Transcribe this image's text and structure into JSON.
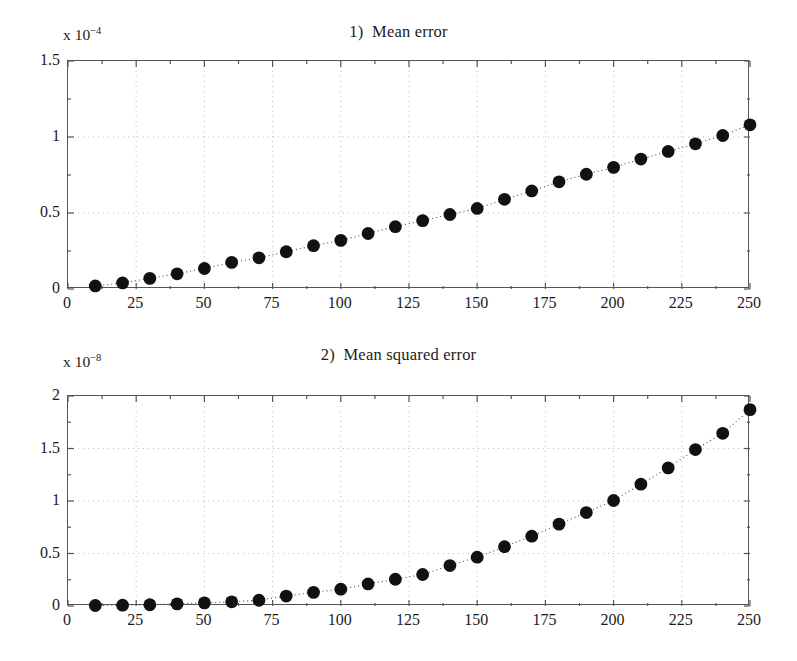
{
  "figure": {
    "background": "#ffffff",
    "marker_color": "#111111",
    "axis_color": "#555555",
    "grid_color": "#bdbdbd"
  },
  "chart_data": [
    {
      "type": "scatter",
      "title": "1)  Mean error",
      "exponent_prefix": "x 10",
      "exponent_value": "−4",
      "scale_factor": 0.0001,
      "xlabel": "",
      "ylabel": "",
      "xlim": [
        0,
        250
      ],
      "ylim": [
        0,
        1.5
      ],
      "grid": true,
      "legend": null,
      "xticks": [
        0,
        25,
        50,
        75,
        100,
        125,
        150,
        175,
        200,
        225,
        250
      ],
      "xtick_labels": [
        "0",
        "25",
        "50",
        "75",
        "100",
        "125",
        "150",
        "175",
        "200",
        "225",
        "250"
      ],
      "yticks": [
        0,
        0.5,
        1,
        1.5
      ],
      "ytick_labels": [
        "0",
        "0.5",
        "1",
        "1.5"
      ],
      "x": [
        10,
        20,
        30,
        40,
        50,
        60,
        70,
        80,
        90,
        100,
        110,
        120,
        130,
        140,
        150,
        160,
        170,
        180,
        190,
        200,
        210,
        220,
        230,
        240,
        250
      ],
      "values": [
        0.02,
        0.04,
        0.07,
        0.1,
        0.135,
        0.175,
        0.205,
        0.245,
        0.285,
        0.32,
        0.365,
        0.41,
        0.45,
        0.49,
        0.53,
        0.59,
        0.645,
        0.705,
        0.755,
        0.8,
        0.855,
        0.905,
        0.955,
        1.01,
        1.08
      ]
    },
    {
      "type": "scatter",
      "title": "2)  Mean squared error",
      "exponent_prefix": "x 10",
      "exponent_value": "−8",
      "scale_factor": 1e-08,
      "xlabel": "",
      "ylabel": "",
      "xlim": [
        0,
        250
      ],
      "ylim": [
        0,
        2
      ],
      "grid": true,
      "legend": null,
      "xticks": [
        0,
        25,
        50,
        75,
        100,
        125,
        150,
        175,
        200,
        225,
        250
      ],
      "xtick_labels": [
        "0",
        "25",
        "50",
        "75",
        "100",
        "125",
        "150",
        "175",
        "200",
        "225",
        "250"
      ],
      "yticks": [
        0,
        0.5,
        1,
        1.5,
        2
      ],
      "ytick_labels": [
        "0",
        "0.5",
        "1",
        "1.5",
        "2"
      ],
      "x": [
        10,
        20,
        30,
        40,
        50,
        60,
        70,
        80,
        90,
        100,
        110,
        120,
        130,
        140,
        150,
        160,
        170,
        180,
        190,
        200,
        210,
        220,
        230,
        240,
        250
      ],
      "values": [
        0.005,
        0.008,
        0.012,
        0.02,
        0.03,
        0.04,
        0.055,
        0.095,
        0.13,
        0.16,
        0.21,
        0.255,
        0.3,
        0.385,
        0.465,
        0.565,
        0.665,
        0.78,
        0.89,
        1.005,
        1.16,
        1.315,
        1.49,
        1.645,
        1.87
      ]
    }
  ]
}
